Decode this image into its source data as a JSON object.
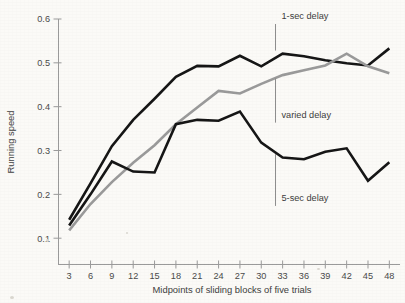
{
  "figure": {
    "background_color": "#fbfaf7",
    "ylabel": "Running speed",
    "xlabel": "Midpoints of sliding blocks of five trials"
  },
  "annotations": {
    "one_sec": "1-sec delay",
    "varied": "varied delay",
    "five_sec": "5-sec delay"
  },
  "axes": {
    "y_ticks": [
      "0.6",
      "0.5",
      "0.4",
      "0.3",
      "0.2",
      "0.1"
    ],
    "x_ticks": [
      "3",
      "6",
      "9",
      "12",
      "15",
      "18",
      "21",
      "24",
      "27",
      "30",
      "33",
      "36",
      "39",
      "42",
      "45",
      "48"
    ]
  },
  "chart_data": {
    "type": "line",
    "title": "",
    "xlabel": "Midpoints of sliding blocks of five trials",
    "ylabel": "Running speed",
    "xlim": [
      1.5,
      49.5
    ],
    "ylim": [
      0.04,
      0.6
    ],
    "grid": false,
    "legend_position": "inline-annotations",
    "x": [
      3,
      6,
      9,
      12,
      15,
      18,
      21,
      24,
      27,
      30,
      33,
      36,
      39,
      42,
      45,
      48
    ],
    "series": [
      {
        "name": "1-sec delay",
        "color": "#161616",
        "width": 2.6,
        "values": [
          0.142,
          0.225,
          0.31,
          0.37,
          0.418,
          0.468,
          0.493,
          0.492,
          0.516,
          0.492,
          0.521,
          0.515,
          0.506,
          0.499,
          0.494,
          0.533
        ]
      },
      {
        "name": "varied delay",
        "color": "#9a9a9a",
        "width": 2.6,
        "values": [
          0.118,
          0.178,
          0.228,
          0.272,
          0.312,
          0.36,
          0.398,
          0.436,
          0.43,
          0.452,
          0.472,
          0.483,
          0.494,
          0.521,
          0.492,
          0.476
        ]
      },
      {
        "name": "5-sec delay",
        "color": "#161616",
        "width": 2.6,
        "values": [
          0.129,
          0.2,
          0.275,
          0.252,
          0.25,
          0.36,
          0.37,
          0.368,
          0.389,
          0.318,
          0.284,
          0.28,
          0.297,
          0.305,
          0.231,
          0.273
        ]
      }
    ],
    "annotations": [
      {
        "text": "1-sec delay",
        "x": 32,
        "y_text": 0.6,
        "leader_to_y": 0.528
      },
      {
        "text": "varied delay",
        "x": 32,
        "y_text": 0.375,
        "leader_to_y": 0.465
      },
      {
        "text": "5-sec delay",
        "x": 32,
        "y_text": 0.185,
        "leader_to_y": 0.292
      }
    ]
  }
}
